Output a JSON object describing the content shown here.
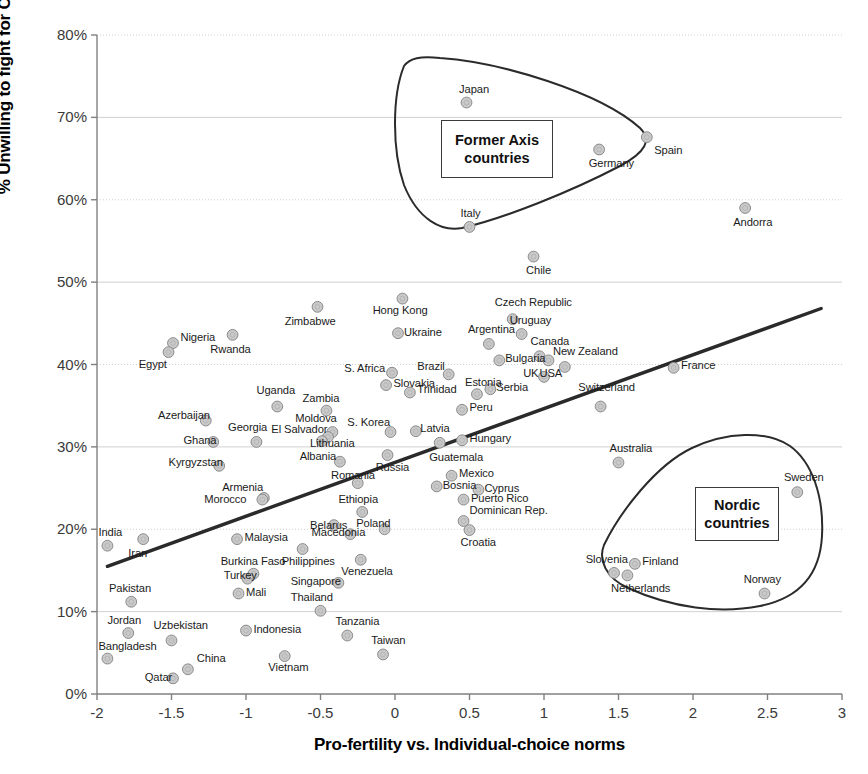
{
  "chart_data": {
    "type": "scatter",
    "title": "",
    "xlabel": "Pro-fertility vs. Individual-choice norms",
    "ylabel": "% Unwilling to fight for Country",
    "xlim": [
      -2,
      3
    ],
    "ylim": [
      0,
      0.8
    ],
    "xticks": [
      "-2",
      "-1.5",
      "-1",
      "-0.5",
      "0",
      "0.5",
      "1",
      "1.5",
      "2",
      "2.5",
      "3"
    ],
    "xtick_values": [
      -2,
      -1.5,
      -1,
      -0.5,
      0,
      0.5,
      1,
      1.5,
      2,
      2.5,
      3
    ],
    "yticks": [
      "0%",
      "10%",
      "20%",
      "30%",
      "40%",
      "50%",
      "60%",
      "70%",
      "80%"
    ],
    "ytick_values": [
      0,
      0.1,
      0.2,
      0.3,
      0.4,
      0.5,
      0.6,
      0.7,
      0.8
    ],
    "grid": true,
    "legend": "none",
    "marker_color": "#c9c9c9",
    "marker_edge": "#8a8a8a",
    "trendline": {
      "x0": -1.93,
      "y0": 0.155,
      "x1": 2.86,
      "y1": 0.468,
      "color": "#2a2a2a"
    },
    "points": [
      {
        "name": "India",
        "x": -1.93,
        "y": 0.18,
        "lx": -1.99,
        "ly": 0.196,
        "anchor": "start"
      },
      {
        "name": "Bangladesh",
        "x": -1.93,
        "y": 0.043,
        "lx": -1.99,
        "ly": 0.057,
        "anchor": "start"
      },
      {
        "name": "Pakistan",
        "x": -1.77,
        "y": 0.112,
        "lx": -1.92,
        "ly": 0.128,
        "anchor": "start"
      },
      {
        "name": "Jordan",
        "x": -1.79,
        "y": 0.074,
        "lx": -1.93,
        "ly": 0.089,
        "anchor": "start"
      },
      {
        "name": "Iran",
        "x": -1.69,
        "y": 0.188,
        "lx": -1.79,
        "ly": 0.17,
        "anchor": "start"
      },
      {
        "name": "Nigeria",
        "x": -1.49,
        "y": 0.426,
        "lx": -1.44,
        "ly": 0.432,
        "anchor": "start"
      },
      {
        "name": "Egypt",
        "x": -1.52,
        "y": 0.415,
        "lx": -1.72,
        "ly": 0.399,
        "anchor": "start"
      },
      {
        "name": "Uzbekistan",
        "x": -1.5,
        "y": 0.065,
        "lx": -1.62,
        "ly": 0.083,
        "anchor": "start"
      },
      {
        "name": "Qatar",
        "x": -1.49,
        "y": 0.019,
        "lx": -1.68,
        "ly": 0.02,
        "anchor": "start"
      },
      {
        "name": "China",
        "x": -1.39,
        "y": 0.03,
        "lx": -1.33,
        "ly": 0.043,
        "anchor": "start"
      },
      {
        "name": "Azerbaijan",
        "x": -1.27,
        "y": 0.332,
        "lx": -1.59,
        "ly": 0.337,
        "anchor": "start"
      },
      {
        "name": "Kyrgyzstan",
        "x": -1.18,
        "y": 0.277,
        "lx": -1.52,
        "ly": 0.28,
        "anchor": "start"
      },
      {
        "name": "Ghana",
        "x": -1.22,
        "y": 0.306,
        "lx": -1.42,
        "ly": 0.307,
        "anchor": "start"
      },
      {
        "name": "Rwanda",
        "x": -1.09,
        "y": 0.436,
        "lx": -1.24,
        "ly": 0.418,
        "anchor": "start"
      },
      {
        "name": "Turkey",
        "x": -0.99,
        "y": 0.14,
        "lx": -1.15,
        "ly": 0.143,
        "anchor": "start"
      },
      {
        "name": "Burkina Faso",
        "x": -0.95,
        "y": 0.146,
        "lx": -1.17,
        "ly": 0.16,
        "anchor": "start"
      },
      {
        "name": "Mali",
        "x": -1.05,
        "y": 0.122,
        "lx": -1.0,
        "ly": 0.123,
        "anchor": "start"
      },
      {
        "name": "Malaysia",
        "x": -1.06,
        "y": 0.188,
        "lx": -1.01,
        "ly": 0.189,
        "anchor": "start"
      },
      {
        "name": "Georgia",
        "x": -0.93,
        "y": 0.306,
        "lx": -1.12,
        "ly": 0.323,
        "anchor": "start"
      },
      {
        "name": "Armenia",
        "x": -0.88,
        "y": 0.238,
        "lx": -1.16,
        "ly": 0.25,
        "anchor": "start"
      },
      {
        "name": "Morocco",
        "x": -0.89,
        "y": 0.236,
        "lx": -1.28,
        "ly": 0.236,
        "anchor": "start"
      },
      {
        "name": "Indonesia",
        "x": -1.0,
        "y": 0.077,
        "lx": -0.95,
        "ly": 0.078,
        "anchor": "start"
      },
      {
        "name": "Uganda",
        "x": -0.79,
        "y": 0.349,
        "lx": -0.93,
        "ly": 0.368,
        "anchor": "start"
      },
      {
        "name": "Vietnam",
        "x": -0.74,
        "y": 0.046,
        "lx": -0.85,
        "ly": 0.032,
        "anchor": "start"
      },
      {
        "name": "Singapore",
        "x": -0.38,
        "y": 0.135,
        "lx": -0.7,
        "ly": 0.136,
        "anchor": "start"
      },
      {
        "name": "Philippines",
        "x": -0.62,
        "y": 0.176,
        "lx": -0.76,
        "ly": 0.16,
        "anchor": "start"
      },
      {
        "name": "Zimbabwe",
        "x": -0.52,
        "y": 0.47,
        "lx": -0.74,
        "ly": 0.452,
        "anchor": "start"
      },
      {
        "name": "Thailand",
        "x": -0.5,
        "y": 0.101,
        "lx": -0.7,
        "ly": 0.116,
        "anchor": "start"
      },
      {
        "name": "Zambia",
        "x": -0.46,
        "y": 0.344,
        "lx": -0.62,
        "ly": 0.358,
        "anchor": "start"
      },
      {
        "name": "Moldova",
        "x": -0.42,
        "y": 0.318,
        "lx": -0.67,
        "ly": 0.334,
        "anchor": "start"
      },
      {
        "name": "El Salvador",
        "x": -0.45,
        "y": 0.312,
        "lx": -0.83,
        "ly": 0.321,
        "anchor": "start"
      },
      {
        "name": "Lithuania",
        "x": -0.49,
        "y": 0.307,
        "lx": -0.57,
        "ly": 0.304,
        "anchor": "start"
      },
      {
        "name": "Belarus",
        "x": -0.41,
        "y": 0.205,
        "lx": -0.57,
        "ly": 0.204,
        "anchor": "start"
      },
      {
        "name": "Albania",
        "x": -0.37,
        "y": 0.282,
        "lx": -0.64,
        "ly": 0.288,
        "anchor": "start"
      },
      {
        "name": "Tanzania",
        "x": -0.32,
        "y": 0.071,
        "lx": -0.4,
        "ly": 0.087,
        "anchor": "start"
      },
      {
        "name": "Macedonia",
        "x": -0.3,
        "y": 0.194,
        "lx": -0.56,
        "ly": 0.196,
        "anchor": "start"
      },
      {
        "name": "Romania",
        "x": -0.25,
        "y": 0.256,
        "lx": -0.43,
        "ly": 0.265,
        "anchor": "start"
      },
      {
        "name": "Ethiopia",
        "x": -0.22,
        "y": 0.221,
        "lx": -0.38,
        "ly": 0.235,
        "anchor": "start"
      },
      {
        "name": "Venezuela",
        "x": -0.23,
        "y": 0.163,
        "lx": -0.36,
        "ly": 0.148,
        "anchor": "start"
      },
      {
        "name": "Taiwan",
        "x": -0.08,
        "y": 0.048,
        "lx": -0.16,
        "ly": 0.064,
        "anchor": "start"
      },
      {
        "name": "S. Africa",
        "x": -0.02,
        "y": 0.39,
        "lx": -0.34,
        "ly": 0.394,
        "anchor": "start"
      },
      {
        "name": "Slovakia",
        "x": -0.06,
        "y": 0.375,
        "lx": -0.01,
        "ly": 0.376,
        "anchor": "start"
      },
      {
        "name": "S. Korea",
        "x": -0.03,
        "y": 0.318,
        "lx": -0.32,
        "ly": 0.329,
        "anchor": "start"
      },
      {
        "name": "Russia",
        "x": -0.05,
        "y": 0.29,
        "lx": -0.13,
        "ly": 0.274,
        "anchor": "start"
      },
      {
        "name": "Poland",
        "x": -0.07,
        "y": 0.2,
        "lx": -0.26,
        "ly": 0.206,
        "anchor": "start"
      },
      {
        "name": "Hong Kong",
        "x": 0.05,
        "y": 0.48,
        "lx": -0.15,
        "ly": 0.465,
        "anchor": "start"
      },
      {
        "name": "Ukraine",
        "x": 0.02,
        "y": 0.438,
        "lx": 0.06,
        "ly": 0.438,
        "anchor": "start"
      },
      {
        "name": "Trinidad",
        "x": 0.1,
        "y": 0.366,
        "lx": 0.15,
        "ly": 0.369,
        "anchor": "start"
      },
      {
        "name": "Latvia",
        "x": 0.14,
        "y": 0.319,
        "lx": 0.17,
        "ly": 0.322,
        "anchor": "start"
      },
      {
        "name": "Brazil",
        "x": 0.36,
        "y": 0.388,
        "lx": 0.15,
        "ly": 0.397,
        "anchor": "start"
      },
      {
        "name": "Guatemala",
        "x": 0.3,
        "y": 0.305,
        "lx": 0.23,
        "ly": 0.286,
        "anchor": "start"
      },
      {
        "name": "Bosnia",
        "x": 0.28,
        "y": 0.252,
        "lx": 0.32,
        "ly": 0.253,
        "anchor": "start"
      },
      {
        "name": "Mexico",
        "x": 0.38,
        "y": 0.265,
        "lx": 0.43,
        "ly": 0.267,
        "anchor": "start"
      },
      {
        "name": "Peru",
        "x": 0.45,
        "y": 0.345,
        "lx": 0.5,
        "ly": 0.347,
        "anchor": "start"
      },
      {
        "name": "Hungary",
        "x": 0.45,
        "y": 0.308,
        "lx": 0.5,
        "ly": 0.31,
        "anchor": "start"
      },
      {
        "name": "Puerto Rico",
        "x": 0.46,
        "y": 0.236,
        "lx": 0.51,
        "ly": 0.237,
        "anchor": "start"
      },
      {
        "name": "Dominican Rep.",
        "x": 0.46,
        "y": 0.21,
        "lx": 0.5,
        "ly": 0.222,
        "anchor": "start"
      },
      {
        "name": "Croatia",
        "x": 0.5,
        "y": 0.199,
        "lx": 0.44,
        "ly": 0.183,
        "anchor": "start"
      },
      {
        "name": "Cyprus",
        "x": 0.56,
        "y": 0.248,
        "lx": 0.6,
        "ly": 0.249,
        "anchor": "start"
      },
      {
        "name": "Estonia",
        "x": 0.55,
        "y": 0.364,
        "lx": 0.47,
        "ly": 0.378,
        "anchor": "start"
      },
      {
        "name": "Serbia",
        "x": 0.64,
        "y": 0.37,
        "lx": 0.68,
        "ly": 0.372,
        "anchor": "start"
      },
      {
        "name": "Argentina",
        "x": 0.63,
        "y": 0.425,
        "lx": 0.49,
        "ly": 0.442,
        "anchor": "start"
      },
      {
        "name": "Bulgaria",
        "x": 0.7,
        "y": 0.405,
        "lx": 0.74,
        "ly": 0.407,
        "anchor": "start"
      },
      {
        "name": "Czech Republic",
        "x": 0.79,
        "y": 0.455,
        "lx": 0.67,
        "ly": 0.475,
        "anchor": "start"
      },
      {
        "name": "Uruguay",
        "x": 0.85,
        "y": 0.437,
        "lx": 0.77,
        "ly": 0.453,
        "anchor": "start"
      },
      {
        "name": "Canada",
        "x": 0.97,
        "y": 0.41,
        "lx": 0.91,
        "ly": 0.427,
        "anchor": "start"
      },
      {
        "name": "Chile",
        "x": 0.93,
        "y": 0.531,
        "lx": 0.88,
        "ly": 0.513,
        "anchor": "start"
      },
      {
        "name": "UK",
        "x": 1.0,
        "y": 0.385,
        "lx": 0.86,
        "ly": 0.388,
        "anchor": "start"
      },
      {
        "name": "USA",
        "x": 1.03,
        "y": 0.405,
        "lx": 0.97,
        "ly": 0.388,
        "anchor": "start"
      },
      {
        "name": "New Zealand",
        "x": 1.14,
        "y": 0.397,
        "lx": 1.06,
        "ly": 0.415,
        "anchor": "start"
      },
      {
        "name": "Switzerland",
        "x": 1.38,
        "y": 0.349,
        "lx": 1.23,
        "ly": 0.371,
        "anchor": "start"
      },
      {
        "name": "Australia",
        "x": 1.5,
        "y": 0.281,
        "lx": 1.44,
        "ly": 0.297,
        "anchor": "start"
      },
      {
        "name": "Japan",
        "x": 0.48,
        "y": 0.718,
        "lx": 0.43,
        "ly": 0.733,
        "anchor": "start"
      },
      {
        "name": "Italy",
        "x": 0.5,
        "y": 0.567,
        "lx": 0.44,
        "ly": 0.583,
        "anchor": "start"
      },
      {
        "name": "Germany",
        "x": 1.37,
        "y": 0.661,
        "lx": 1.3,
        "ly": 0.644,
        "anchor": "start"
      },
      {
        "name": "Spain",
        "x": 1.69,
        "y": 0.676,
        "lx": 1.74,
        "ly": 0.659,
        "anchor": "start"
      },
      {
        "name": "France",
        "x": 1.87,
        "y": 0.396,
        "lx": 1.92,
        "ly": 0.398,
        "anchor": "start"
      },
      {
        "name": "Andorra",
        "x": 2.35,
        "y": 0.59,
        "lx": 2.27,
        "ly": 0.572,
        "anchor": "start"
      },
      {
        "name": "Slovenia",
        "x": 1.47,
        "y": 0.147,
        "lx": 1.28,
        "ly": 0.163,
        "anchor": "start"
      },
      {
        "name": "Netherlands",
        "x": 1.56,
        "y": 0.144,
        "lx": 1.45,
        "ly": 0.128,
        "anchor": "start"
      },
      {
        "name": "Finland",
        "x": 1.61,
        "y": 0.158,
        "lx": 1.66,
        "ly": 0.16,
        "anchor": "start"
      },
      {
        "name": "Norway",
        "x": 2.48,
        "y": 0.122,
        "lx": 2.34,
        "ly": 0.138,
        "anchor": "start"
      },
      {
        "name": "Sweden",
        "x": 2.7,
        "y": 0.245,
        "lx": 2.61,
        "ly": 0.262,
        "anchor": "start"
      }
    ],
    "annotations": [
      {
        "id": "former-axis",
        "text": "Former Axis\ncountries",
        "line1": "Former Axis",
        "line2": "countries"
      },
      {
        "id": "nordic",
        "text": "Nordic\ncountries",
        "line1": "Nordic",
        "line2": "countries"
      }
    ]
  }
}
